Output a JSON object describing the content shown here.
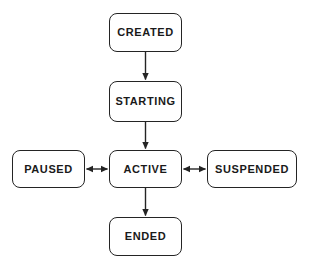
{
  "diagram": {
    "type": "state-machine",
    "canvas": {
      "width": 309,
      "height": 270,
      "background": "#ffffff"
    },
    "style": {
      "node_border_color": "#242424",
      "node_fill_color": "#ffffff",
      "edge_color": "#242424",
      "label_color": "#1a1a1a"
    },
    "nodes": [
      {
        "id": "created",
        "label": "CREATED",
        "x": 109,
        "y": 13,
        "width": 73,
        "height": 39
      },
      {
        "id": "starting",
        "label": "STARTING",
        "x": 109,
        "y": 81,
        "width": 73,
        "height": 41
      },
      {
        "id": "active",
        "label": "ACTIVE",
        "x": 109,
        "y": 150,
        "width": 73,
        "height": 38
      },
      {
        "id": "paused",
        "label": "PAUSED",
        "x": 12,
        "y": 150,
        "width": 73,
        "height": 38
      },
      {
        "id": "suspended",
        "label": "SUSPENDED",
        "x": 207,
        "y": 150,
        "width": 90,
        "height": 38
      },
      {
        "id": "ended",
        "label": "ENDED",
        "x": 109,
        "y": 217,
        "width": 73,
        "height": 39
      }
    ],
    "edges": [
      {
        "id": "created-to-starting",
        "from": "created",
        "to": "starting",
        "direction": "one-way",
        "orientation": "vertical"
      },
      {
        "id": "starting-to-active",
        "from": "starting",
        "to": "active",
        "direction": "one-way",
        "orientation": "vertical"
      },
      {
        "id": "active-to-ended",
        "from": "active",
        "to": "ended",
        "direction": "one-way",
        "orientation": "vertical"
      },
      {
        "id": "paused-active",
        "from": "paused",
        "to": "active",
        "direction": "two-way",
        "orientation": "horizontal"
      },
      {
        "id": "active-suspended",
        "from": "active",
        "to": "suspended",
        "direction": "two-way",
        "orientation": "horizontal"
      }
    ]
  }
}
